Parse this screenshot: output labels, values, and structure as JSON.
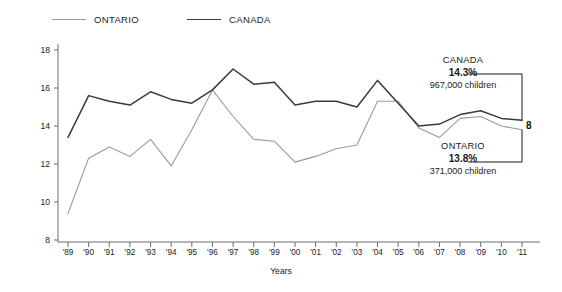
{
  "legend": {
    "items": [
      {
        "label": "ONTARIO",
        "color": "#9a9a9a"
      },
      {
        "label": "CANADA",
        "color": "#3a3a3a"
      }
    ]
  },
  "annotations": {
    "canada": {
      "head": "CANADA",
      "pct": "14.3%",
      "sub": "967,000 children"
    },
    "ontario": {
      "head": "ONTARIO",
      "pct": "13.8%",
      "sub": "371,000 children"
    }
  },
  "page_number": "8",
  "chart_data": {
    "type": "line",
    "title": "",
    "xlabel": "Years",
    "ylabel": "Per cent of children in low-income households",
    "grid": false,
    "legend_position": "top-left",
    "ylim": [
      8,
      18
    ],
    "yticks": [
      8,
      10,
      12,
      14,
      16,
      18
    ],
    "categories": [
      "'89",
      "'90",
      "'91",
      "'92",
      "'93",
      "'94",
      "'95",
      "'96",
      "'97",
      "'98",
      "'99",
      "'00",
      "'01",
      "'02",
      "'03",
      "'04",
      "'05",
      "'06",
      "'07",
      "'08",
      "'09",
      "'10",
      "'11"
    ],
    "series": [
      {
        "name": "ONTARIO",
        "color": "#9a9a9a",
        "values": [
          9.4,
          12.3,
          12.9,
          12.4,
          13.3,
          11.9,
          13.8,
          15.9,
          14.5,
          13.3,
          13.2,
          12.1,
          12.4,
          12.8,
          13.0,
          15.3,
          15.3,
          13.9,
          13.4,
          14.4,
          14.5,
          14.0,
          13.8
        ]
      },
      {
        "name": "CANADA",
        "color": "#3a3a3a",
        "values": [
          13.4,
          15.6,
          15.3,
          15.1,
          15.8,
          15.4,
          15.2,
          15.9,
          17.0,
          16.2,
          16.3,
          15.1,
          15.3,
          15.3,
          15.0,
          16.4,
          15.2,
          14.0,
          14.1,
          14.6,
          14.8,
          14.4,
          14.3
        ]
      }
    ]
  }
}
